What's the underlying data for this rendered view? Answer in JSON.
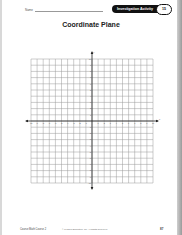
{
  "header": {
    "name_label": "Name",
    "badge_label": "Investigation Activity",
    "badge_number": "15"
  },
  "title": "Coordinate Plane",
  "grid": {
    "columns": 20,
    "rows": 20,
    "x_range": [
      -10,
      10
    ],
    "y_range": [
      -10,
      10
    ],
    "line_color": "#9a9a9a",
    "axis_color": "#222222"
  },
  "footer": {
    "left": "Course Math Course 2",
    "middle": "© Pearson Education, Inc. All Rights Reserved.",
    "page_number": "87"
  }
}
